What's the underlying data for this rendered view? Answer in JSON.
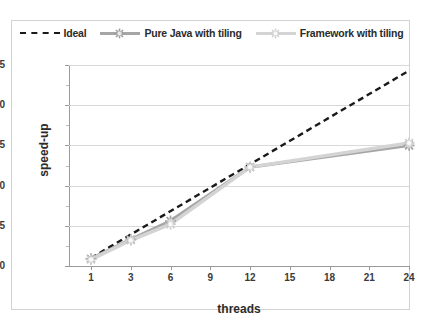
{
  "chart_data": {
    "type": "line",
    "title": "",
    "xlabel": "threads",
    "ylabel": "speed-up",
    "x": [
      1,
      3,
      6,
      9,
      12,
      15,
      18,
      21,
      24
    ],
    "xtick_labels": [
      "1",
      "3",
      "6",
      "9",
      "12",
      "15",
      "18",
      "21",
      "24"
    ],
    "ytick_labels": [
      "0",
      "5",
      "10",
      "15",
      "20",
      "25"
    ],
    "yticks": [
      0,
      5,
      10,
      15,
      20,
      25
    ],
    "ylim": [
      0,
      25
    ],
    "grid": "horizontal",
    "legend_position": "top-center",
    "series": [
      {
        "name": "Ideal",
        "style": "dashed",
        "color": "#1a1a1a",
        "marker": "none",
        "x": [
          1,
          24
        ],
        "values": [
          1.0,
          24.3
        ]
      },
      {
        "name": "Pure Java with tiling",
        "style": "solid",
        "color": "#a6a6a6",
        "marker": "starburst",
        "x": [
          1,
          3,
          6,
          12,
          24
        ],
        "values": [
          0.9,
          3.3,
          5.6,
          12.3,
          15.0
        ]
      },
      {
        "name": "Framework with tiling",
        "style": "solid",
        "color": "#d4d4d4",
        "marker": "starburst",
        "x": [
          1,
          3,
          6,
          12,
          24
        ],
        "values": [
          0.8,
          3.2,
          5.2,
          12.3,
          15.3
        ]
      }
    ]
  },
  "legend": {
    "entries": [
      {
        "label": "Ideal",
        "swatch": "dashed"
      },
      {
        "label": "Pure Java with tiling",
        "swatch": "gray"
      },
      {
        "label": "Framework with tiling",
        "swatch": "lightgray"
      }
    ]
  },
  "axes": {
    "y_title": "speed-up",
    "x_title": "threads",
    "y_ticks": [
      "25",
      "20",
      "15",
      "10",
      "5",
      "0"
    ],
    "x_ticks": [
      "1",
      "3",
      "6",
      "9",
      "12",
      "15",
      "18",
      "21",
      "24"
    ]
  }
}
